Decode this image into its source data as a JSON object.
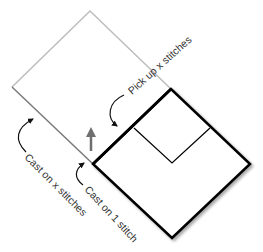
{
  "diagram": {
    "labels": {
      "pick_up": "Pick up x stitches",
      "cast_on_x": "Cast on x stitches",
      "cast_on_1": "Cast on 1 stitch"
    },
    "colors": {
      "previous_square": "#b5b5b5",
      "previous_square_cast_edge": "#7a7a7a",
      "current_square": "#000000",
      "direction_arrow": "#6f6f6f",
      "text": "#333333"
    },
    "shapes": {
      "previous_square": "light grey diamond (completed square)",
      "current_square": "black diamond with inner mitered notch",
      "direction_arrow": "upward knitting direction arrow"
    }
  }
}
